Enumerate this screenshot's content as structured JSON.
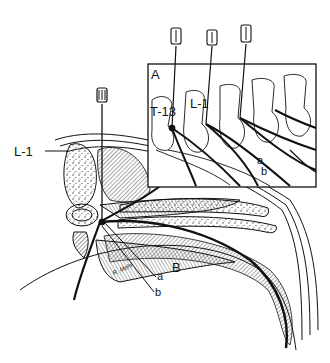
{
  "figure": {
    "colors": {
      "ink": "#111111",
      "background": "#ffffff",
      "hatch": "#444444"
    },
    "inset": {
      "panel_label": "A",
      "vertebra_labels": [
        "T-13",
        "L-1"
      ],
      "nerve_labels": [
        "a",
        "b"
      ],
      "needle_count": 3
    },
    "section": {
      "panel_label": "B",
      "level_label": "L-1",
      "nerve_labels": [
        "a",
        "b"
      ],
      "needle_count": 1,
      "signature": "R. Mehr"
    }
  }
}
